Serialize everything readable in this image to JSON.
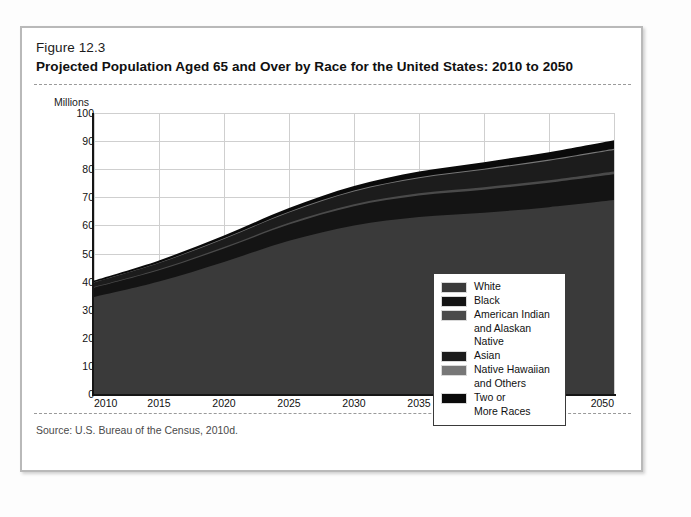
{
  "figure": {
    "number": "Figure 12.3",
    "title": "Projected Population Aged 65 and Over by Race for the United States: 2010 to 2050",
    "source": "Source: U.S. Bureau of the Census, 2010d."
  },
  "axis": {
    "y_unit_label": "Millions",
    "y_ticks": [
      "100",
      "90",
      "80",
      "70",
      "60",
      "50",
      "40",
      "30",
      "20",
      "10",
      "0"
    ],
    "x_ticks": [
      "2010",
      "2015",
      "2020",
      "2025",
      "2030",
      "2035",
      "2040",
      "2045",
      "2050"
    ]
  },
  "legend": {
    "items": [
      {
        "label": "White",
        "label2": "",
        "color": "#3a3a3a"
      },
      {
        "label": "Black",
        "label2": "",
        "color": "#141414"
      },
      {
        "label": "American Indian",
        "label2": "and Alaskan Native",
        "color": "#4a4a4a"
      },
      {
        "label": "Asian",
        "label2": "",
        "color": "#1c1c1c"
      },
      {
        "label": "Native Hawaiian",
        "label2": "and Others",
        "color": "#777777"
      },
      {
        "label": "Two or",
        "label2": "More Races",
        "color": "#0a0a0a"
      }
    ]
  },
  "chart_data": {
    "type": "area",
    "stacked": true,
    "title": "Projected Population Aged 65 and Over by Race for the United States: 2010 to 2050",
    "xlabel": "",
    "ylabel": "Millions",
    "ylim": [
      0,
      100
    ],
    "xlim": [
      2010,
      2050
    ],
    "grid": true,
    "legend_position": "inside-right",
    "x": [
      2010,
      2015,
      2020,
      2025,
      2030,
      2035,
      2040,
      2045,
      2050
    ],
    "series": [
      {
        "name": "White",
        "color": "#3a3a3a",
        "values": [
          34.5,
          40.0,
          47.0,
          54.5,
          60.0,
          63.0,
          64.5,
          66.5,
          69.0
        ]
      },
      {
        "name": "Black",
        "color": "#141414",
        "values": [
          3.3,
          4.0,
          4.8,
          5.8,
          6.8,
          7.6,
          8.2,
          8.7,
          9.2
        ]
      },
      {
        "name": "American Indian and Alaskan Native",
        "color": "#4a4a4a",
        "values": [
          0.3,
          0.4,
          0.5,
          0.6,
          0.7,
          0.8,
          0.9,
          0.9,
          1.0
        ]
      },
      {
        "name": "Asian",
        "color": "#1c1c1c",
        "values": [
          1.6,
          2.2,
          2.9,
          3.7,
          4.6,
          5.4,
          6.2,
          6.9,
          7.6
        ]
      },
      {
        "name": "Native Hawaiian and Others",
        "color": "#777777",
        "values": [
          0.1,
          0.15,
          0.2,
          0.25,
          0.3,
          0.35,
          0.4,
          0.45,
          0.5
        ]
      },
      {
        "name": "Two or More Races",
        "color": "#0a0a0a",
        "values": [
          0.6,
          0.8,
          1.0,
          1.3,
          1.6,
          2.0,
          2.3,
          2.6,
          3.0
        ]
      }
    ],
    "totals": [
      40.4,
      47.55,
      56.4,
      66.15,
      74.0,
      79.15,
      82.5,
      86.05,
      90.3
    ]
  }
}
